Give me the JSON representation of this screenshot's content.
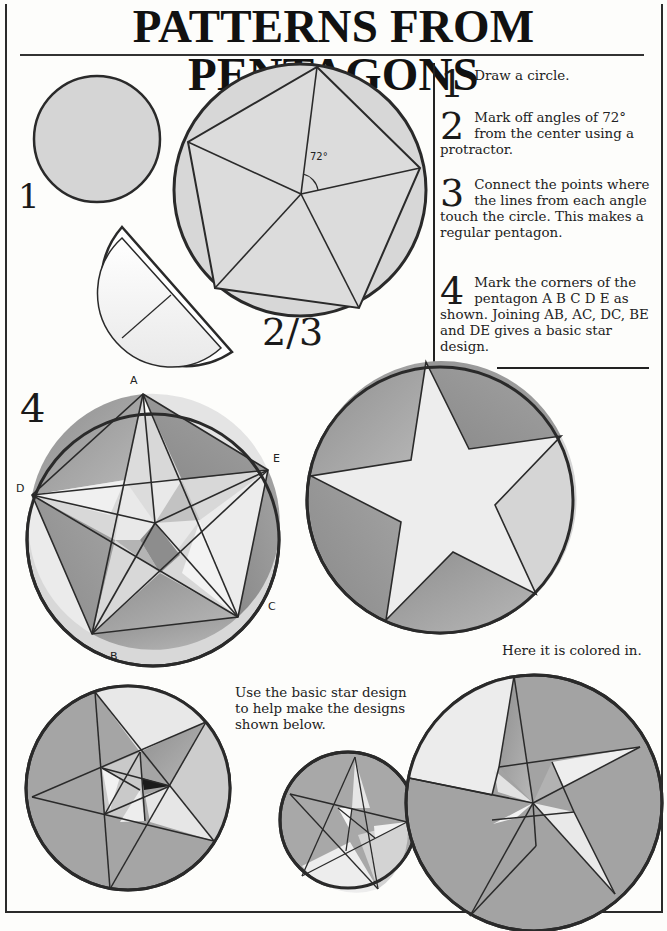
{
  "page": {
    "title": "PATTERNS FROM PENTAGONS",
    "steps": [
      {
        "number": "1",
        "text": "Draw a circle."
      },
      {
        "number": "2",
        "text": "Mark off angles of 72° from the center using a protractor."
      },
      {
        "number": "3",
        "text": "Connect the points where the lines from each angle touch the circle. This makes a regular pentagon."
      },
      {
        "number": "4",
        "text": "Mark the corners of the pentagon A B C D E as shown. Joining AB, AC, DC, BE and DE gives a basic star design."
      }
    ],
    "figure_labels": {
      "step1": "1",
      "step23": "2/3",
      "step4": "4",
      "angle": "72°"
    },
    "vertex_labels": {
      "A": "A",
      "B": "B",
      "C": "C",
      "D": "D",
      "E": "E"
    },
    "captions": {
      "colored": "Here it is colored in.",
      "use_star": "Use the basic star design to help make the designs shown below."
    },
    "colors": {
      "line": "#2a2a2a",
      "light_fill": "#e6e6e6",
      "mid_fill": "#a9a9a9",
      "dark_fill": "#8c8c8c",
      "pale_fill": "#f1f1f1",
      "accent_dark": "#1b1b1b",
      "circle_fill": "#d4d4d4"
    }
  }
}
